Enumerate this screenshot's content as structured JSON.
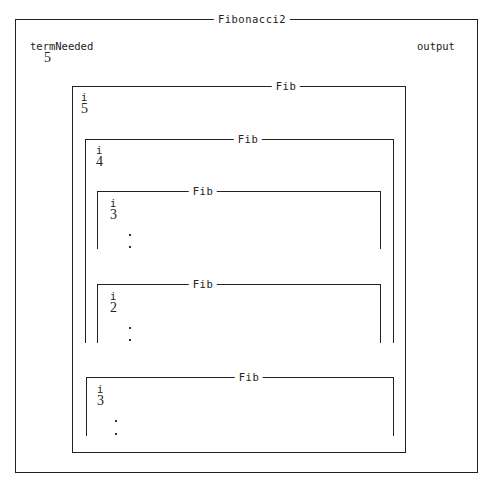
{
  "main": {
    "title": "Fibonacci2",
    "variables": [
      {
        "name": "termNeeded",
        "value": "5"
      },
      {
        "name": "output",
        "value": ""
      }
    ]
  },
  "frames": [
    {
      "title": "Fib",
      "var_name": "i",
      "var_value": "5"
    },
    {
      "title": "Fib",
      "var_name": "i",
      "var_value": "4"
    },
    {
      "title": "Fib",
      "var_name": "i",
      "var_value": "3",
      "ellipsis": ".\n."
    },
    {
      "title": "Fib",
      "var_name": "i",
      "var_value": "2",
      "ellipsis": ".\n."
    },
    {
      "title": "Fib",
      "var_name": "i",
      "var_value": "3",
      "ellipsis": ".\n."
    }
  ]
}
